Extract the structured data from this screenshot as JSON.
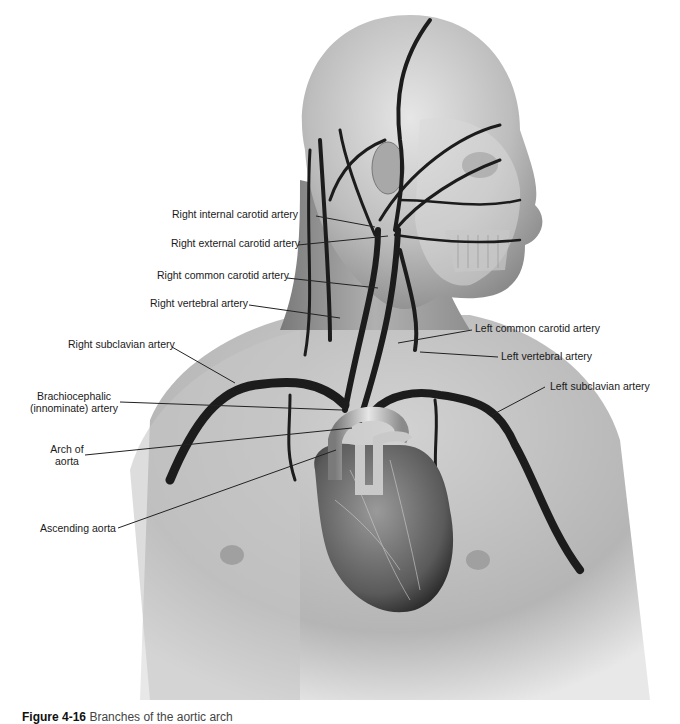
{
  "figure": {
    "caption": {
      "number": "Figure 4-16",
      "text": "Branches of the aortic arch"
    },
    "labels": {
      "right_internal_carotid": "Right internal carotid artery",
      "right_external_carotid": "Right external carotid artery",
      "right_common_carotid": "Right common carotid artery",
      "right_vertebral": "Right vertebral artery",
      "right_subclavian": "Right subclavian artery",
      "brachiocephalic_line1": "Brachiocephalic",
      "brachiocephalic_line2": "(innominate) artery",
      "arch_line1": "Arch of",
      "arch_line2": "aorta",
      "ascending_aorta": "Ascending aorta",
      "left_common_carotid": "Left common carotid artery",
      "left_vertebral": "Left vertebral artery",
      "left_subclavian": "Left subclavian artery"
    },
    "colors": {
      "skin_light": "#d9d9d9",
      "skin_mid": "#b8b8b8",
      "skin_dark": "#8e8e8e",
      "artery": "#1c1c1c",
      "leader_line": "#222222"
    }
  }
}
